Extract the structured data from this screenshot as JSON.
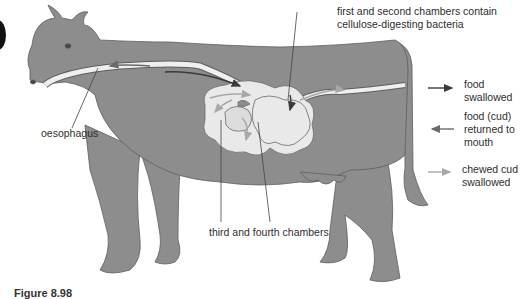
{
  "figure": {
    "caption": "Figure 8.98",
    "colors": {
      "cow_body": "#8d8d8d",
      "cow_outline": "#5e5e5e",
      "stomach": "#e9e9e9",
      "tube": "#efefef",
      "arrow_swallowed": "#3a3a3a",
      "arrow_returned": "#6a6a6a",
      "arrow_chewed": "#a8a8a8",
      "background": "#ffffff"
    }
  },
  "labels": {
    "oesophagus": "oesophagus",
    "first_second_line1": "first and second chambers contain",
    "first_second_line2": "cellulose-digesting bacteria",
    "third_fourth": "third and fourth chambers"
  },
  "legend": {
    "items": [
      {
        "key": "food-swallowed",
        "line1": "food",
        "line2": "swallowed",
        "line3": "",
        "direction": "right",
        "color": "#3a3a3a"
      },
      {
        "key": "food-returned",
        "line1": "food (cud)",
        "line2": "returned to",
        "line3": "mouth",
        "direction": "left",
        "color": "#6a6a6a"
      },
      {
        "key": "chewed-cud-swallowed",
        "line1": "chewed cud",
        "line2": "swallowed",
        "line3": "",
        "direction": "right",
        "color": "#a8a8a8"
      }
    ]
  }
}
